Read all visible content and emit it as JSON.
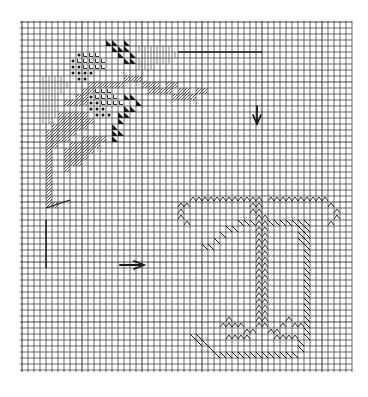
{
  "chart": {
    "kind": "needlepoint-stitch-chart",
    "grid": {
      "origin_x": 22,
      "origin_y": 22,
      "cell": 6,
      "cols": 55,
      "rows": 58,
      "line_color": "#2a2a2a",
      "background": "#ffffff"
    },
    "colors": {
      "ink": "#1a1a1a",
      "hatch": "#3a3a3a",
      "light_hatch": "#6a6a6a"
    },
    "markers": {
      "center_arrow_down": {
        "label": "down-arrow",
        "col": 39,
        "row": 14
      },
      "center_arrow_right": {
        "label": "right-arrow",
        "col": 17,
        "row": 40
      },
      "top_line": {
        "from_col": 26,
        "to_col": 40,
        "row": 5
      },
      "left_vline": {
        "col": 4,
        "from_row": 33,
        "to_row": 41
      },
      "left_hline": {
        "from_col": 4,
        "to_col": 8,
        "row": 31
      }
    },
    "stitches": {
      "solid_triangle": [
        [
          14,
          3
        ],
        [
          15,
          3
        ],
        [
          17,
          3
        ],
        [
          15,
          4
        ],
        [
          16,
          4
        ],
        [
          17,
          4
        ],
        [
          16,
          5
        ],
        [
          18,
          5
        ],
        [
          17,
          6
        ],
        [
          18,
          6
        ],
        [
          17,
          12
        ],
        [
          18,
          12
        ],
        [
          19,
          13
        ],
        [
          17,
          14
        ],
        [
          18,
          14
        ],
        [
          16,
          15
        ],
        [
          17,
          15
        ],
        [
          16,
          16
        ],
        [
          15,
          17
        ],
        [
          15,
          18
        ],
        [
          15,
          19
        ],
        [
          16,
          18
        ]
      ],
      "dot": [
        [
          9,
          5
        ],
        [
          8,
          6
        ],
        [
          8,
          7
        ],
        [
          9,
          7
        ],
        [
          8,
          8
        ],
        [
          9,
          8
        ],
        [
          10,
          8
        ],
        [
          11,
          8
        ],
        [
          9,
          9
        ],
        [
          10,
          9
        ],
        [
          11,
          12
        ],
        [
          11,
          13
        ],
        [
          12,
          13
        ],
        [
          11,
          14
        ],
        [
          12,
          14
        ],
        [
          13,
          14
        ],
        [
          12,
          15
        ],
        [
          13,
          15
        ],
        [
          14,
          15
        ]
      ],
      "check": [
        [
          10,
          5
        ],
        [
          11,
          5
        ],
        [
          12,
          5
        ],
        [
          9,
          6
        ],
        [
          10,
          6
        ],
        [
          11,
          6
        ],
        [
          12,
          6
        ],
        [
          13,
          6
        ],
        [
          10,
          7
        ],
        [
          11,
          7
        ],
        [
          12,
          7
        ],
        [
          13,
          7
        ],
        [
          12,
          11
        ],
        [
          13,
          11
        ],
        [
          14,
          11
        ],
        [
          12,
          12
        ],
        [
          13,
          12
        ],
        [
          14,
          12
        ],
        [
          15,
          12
        ],
        [
          13,
          13
        ],
        [
          14,
          13
        ],
        [
          15,
          13
        ],
        [
          16,
          13
        ]
      ],
      "hatch": [
        [
          17,
          9
        ],
        [
          18,
          9
        ],
        [
          19,
          9
        ],
        [
          20,
          10
        ],
        [
          21,
          10
        ],
        [
          22,
          10
        ],
        [
          23,
          11
        ],
        [
          24,
          11
        ],
        [
          21,
          11
        ],
        [
          22,
          11
        ],
        [
          24,
          10
        ],
        [
          25,
          10
        ],
        [
          26,
          11
        ],
        [
          27,
          11
        ],
        [
          25,
          12
        ],
        [
          26,
          12
        ],
        [
          27,
          12
        ],
        [
          28,
          12
        ],
        [
          29,
          11
        ],
        [
          30,
          11
        ],
        [
          11,
          10
        ],
        [
          12,
          10
        ],
        [
          13,
          10
        ],
        [
          14,
          10
        ],
        [
          10,
          11
        ],
        [
          11,
          11
        ],
        [
          9,
          12
        ],
        [
          10,
          12
        ],
        [
          15,
          10
        ],
        [
          16,
          10
        ],
        [
          7,
          13
        ],
        [
          8,
          13
        ],
        [
          9,
          13
        ],
        [
          10,
          13
        ],
        [
          6,
          15
        ],
        [
          7,
          15
        ],
        [
          8,
          15
        ],
        [
          9,
          15
        ],
        [
          10,
          15
        ],
        [
          6,
          16
        ],
        [
          7,
          16
        ],
        [
          8,
          16
        ],
        [
          9,
          16
        ],
        [
          10,
          16
        ],
        [
          11,
          16
        ],
        [
          5,
          17
        ],
        [
          6,
          17
        ],
        [
          7,
          17
        ],
        [
          8,
          17
        ],
        [
          9,
          17
        ],
        [
          10,
          17
        ],
        [
          4,
          18
        ],
        [
          5,
          18
        ],
        [
          6,
          18
        ],
        [
          7,
          18
        ],
        [
          8,
          18
        ],
        [
          4,
          19
        ],
        [
          5,
          19
        ],
        [
          6,
          19
        ],
        [
          7,
          19
        ],
        [
          10,
          19
        ],
        [
          11,
          19
        ],
        [
          12,
          19
        ],
        [
          13,
          19
        ],
        [
          4,
          20
        ],
        [
          5,
          20
        ],
        [
          8,
          20
        ],
        [
          9,
          20
        ],
        [
          10,
          20
        ],
        [
          11,
          20
        ],
        [
          12,
          20
        ],
        [
          4,
          21
        ],
        [
          7,
          21
        ],
        [
          8,
          21
        ],
        [
          9,
          21
        ],
        [
          10,
          21
        ],
        [
          11,
          21
        ],
        [
          4,
          22
        ],
        [
          7,
          22
        ],
        [
          8,
          22
        ],
        [
          9,
          22
        ],
        [
          10,
          22
        ],
        [
          4,
          23
        ],
        [
          7,
          23
        ],
        [
          8,
          23
        ],
        [
          9,
          23
        ],
        [
          4,
          24
        ],
        [
          7,
          24
        ],
        [
          4,
          25
        ],
        [
          4,
          26
        ],
        [
          4,
          27
        ],
        [
          4,
          28
        ],
        [
          4,
          29
        ],
        [
          4,
          30
        ],
        [
          5,
          30
        ]
      ],
      "vertical_lines": [
        [
          3,
          9
        ],
        [
          4,
          9
        ],
        [
          5,
          9
        ],
        [
          6,
          9
        ],
        [
          3,
          10
        ],
        [
          4,
          10
        ],
        [
          5,
          10
        ],
        [
          6,
          10
        ],
        [
          7,
          10
        ],
        [
          3,
          11
        ],
        [
          4,
          11
        ],
        [
          5,
          11
        ],
        [
          6,
          11
        ],
        [
          3,
          12
        ],
        [
          4,
          12
        ],
        [
          5,
          12
        ],
        [
          3,
          13
        ],
        [
          4,
          13
        ],
        [
          5,
          13
        ],
        [
          3,
          14
        ],
        [
          4,
          14
        ],
        [
          5,
          14
        ],
        [
          3,
          15
        ],
        [
          4,
          15
        ],
        [
          5,
          15
        ],
        [
          3,
          16
        ],
        [
          4,
          16
        ],
        [
          19,
          4
        ],
        [
          20,
          4
        ],
        [
          21,
          4
        ],
        [
          22,
          4
        ],
        [
          23,
          4
        ],
        [
          24,
          4
        ],
        [
          20,
          5
        ],
        [
          21,
          5
        ],
        [
          22,
          5
        ],
        [
          23,
          5
        ],
        [
          24,
          5
        ],
        [
          25,
          5
        ],
        [
          19,
          6
        ],
        [
          20,
          6
        ],
        [
          21,
          6
        ],
        [
          22,
          6
        ],
        [
          23,
          6
        ],
        [
          24,
          6
        ],
        [
          19,
          7
        ],
        [
          20,
          7
        ],
        [
          21,
          7
        ]
      ],
      "zigzag": [
        [
          28,
          29
        ],
        [
          29,
          29
        ],
        [
          30,
          29
        ],
        [
          31,
          29
        ],
        [
          32,
          29
        ],
        [
          33,
          29
        ],
        [
          34,
          29
        ],
        [
          35,
          29
        ],
        [
          36,
          29
        ],
        [
          37,
          29
        ],
        [
          38,
          29
        ],
        [
          39,
          29
        ],
        [
          41,
          29
        ],
        [
          42,
          29
        ],
        [
          43,
          29
        ],
        [
          44,
          29
        ],
        [
          45,
          29
        ],
        [
          46,
          29
        ],
        [
          47,
          29
        ],
        [
          48,
          29
        ],
        [
          49,
          29
        ],
        [
          50,
          29
        ],
        [
          27,
          30
        ],
        [
          26,
          30
        ],
        [
          51,
          30
        ],
        [
          52,
          31
        ],
        [
          26,
          31
        ],
        [
          26,
          32
        ],
        [
          52,
          32
        ],
        [
          27,
          33
        ],
        [
          51,
          33
        ],
        [
          38,
          30
        ],
        [
          39,
          30
        ],
        [
          38,
          31
        ],
        [
          39,
          31
        ],
        [
          39,
          32
        ],
        [
          40,
          32
        ],
        [
          39,
          33
        ],
        [
          40,
          33
        ],
        [
          39,
          34
        ],
        [
          40,
          34
        ],
        [
          39,
          35
        ],
        [
          40,
          35
        ],
        [
          39,
          36
        ],
        [
          40,
          36
        ],
        [
          39,
          37
        ],
        [
          40,
          37
        ],
        [
          39,
          38
        ],
        [
          40,
          38
        ],
        [
          39,
          39
        ],
        [
          40,
          39
        ],
        [
          39,
          40
        ],
        [
          40,
          40
        ],
        [
          39,
          41
        ],
        [
          40,
          41
        ],
        [
          39,
          42
        ],
        [
          40,
          42
        ],
        [
          39,
          43
        ],
        [
          40,
          43
        ],
        [
          39,
          44
        ],
        [
          40,
          44
        ],
        [
          39,
          45
        ],
        [
          40,
          45
        ],
        [
          39,
          46
        ],
        [
          40,
          46
        ],
        [
          39,
          47
        ],
        [
          40,
          47
        ],
        [
          39,
          48
        ],
        [
          40,
          48
        ],
        [
          39,
          49
        ],
        [
          40,
          49
        ],
        [
          39,
          50
        ],
        [
          40,
          50
        ],
        [
          34,
          49
        ],
        [
          35,
          50
        ],
        [
          33,
          50
        ],
        [
          34,
          50
        ],
        [
          36,
          50
        ],
        [
          37,
          51
        ],
        [
          38,
          51
        ],
        [
          44,
          49
        ],
        [
          45,
          50
        ],
        [
          43,
          50
        ],
        [
          46,
          50
        ],
        [
          42,
          51
        ],
        [
          41,
          51
        ],
        [
          34,
          52
        ],
        [
          35,
          52
        ],
        [
          36,
          52
        ],
        [
          37,
          52
        ],
        [
          42,
          52
        ],
        [
          43,
          52
        ],
        [
          44,
          52
        ],
        [
          45,
          52
        ]
      ],
      "diag_hatch": [
        [
          36,
          33
        ],
        [
          37,
          33
        ],
        [
          38,
          33
        ],
        [
          41,
          33
        ],
        [
          42,
          33
        ],
        [
          43,
          33
        ],
        [
          44,
          33
        ],
        [
          45,
          33
        ],
        [
          46,
          33
        ],
        [
          47,
          33
        ],
        [
          35,
          34
        ],
        [
          34,
          34
        ],
        [
          33,
          35
        ],
        [
          32,
          36
        ],
        [
          31,
          37
        ],
        [
          30,
          37
        ],
        [
          46,
          34
        ],
        [
          47,
          34
        ],
        [
          46,
          35
        ],
        [
          47,
          35
        ],
        [
          46,
          36
        ],
        [
          47,
          36
        ],
        [
          47,
          37
        ],
        [
          47,
          38
        ],
        [
          47,
          39
        ],
        [
          47,
          40
        ],
        [
          47,
          41
        ],
        [
          47,
          42
        ],
        [
          47,
          43
        ],
        [
          47,
          44
        ],
        [
          47,
          45
        ],
        [
          47,
          46
        ],
        [
          47,
          47
        ],
        [
          47,
          48
        ],
        [
          47,
          49
        ],
        [
          47,
          50
        ],
        [
          47,
          51
        ],
        [
          47,
          52
        ],
        [
          46,
          53
        ],
        [
          46,
          54
        ],
        [
          45,
          55
        ],
        [
          29,
          52
        ],
        [
          30,
          53
        ],
        [
          31,
          54
        ],
        [
          32,
          55
        ],
        [
          33,
          55
        ],
        [
          34,
          55
        ],
        [
          35,
          55
        ],
        [
          36,
          55
        ],
        [
          37,
          55
        ],
        [
          38,
          55
        ],
        [
          39,
          55
        ],
        [
          40,
          55
        ],
        [
          41,
          55
        ],
        [
          42,
          55
        ],
        [
          43,
          55
        ],
        [
          44,
          55
        ],
        [
          29,
          53
        ],
        [
          28,
          52
        ]
      ]
    }
  }
}
